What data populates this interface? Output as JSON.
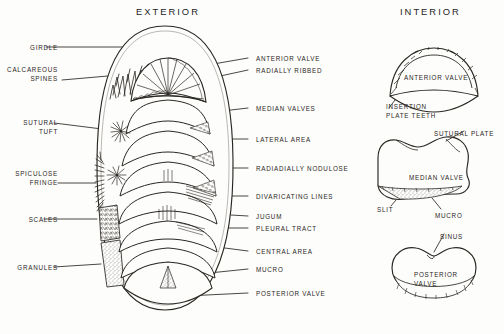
{
  "figure": {
    "kind": "scientific-illustration",
    "style": "hand-drawn ink line diagram",
    "background_color": "#fdfdfc",
    "ink_color": "#2a2722"
  },
  "panels": {
    "exterior": {
      "title": "EXTERIOR"
    },
    "interior": {
      "title": "INTERIOR"
    }
  },
  "left_labels": [
    {
      "id": "girdle",
      "lines": [
        "GIRDLE"
      ],
      "x": 14,
      "y": 44,
      "lead_from": [
        46,
        47
      ],
      "lead_to": [
        150,
        47
      ]
    },
    {
      "id": "calcareous-spines",
      "lines": [
        "CALCAREOUS",
        "SPINES"
      ],
      "x": 14,
      "y": 66,
      "lead_from": [
        62,
        80
      ],
      "lead_to": [
        131,
        74
      ]
    },
    {
      "id": "sutural-tuft",
      "lines": [
        "SUTURAL",
        "TUFT"
      ],
      "x": 14,
      "y": 119,
      "lead_from": [
        54,
        123
      ],
      "lead_to": [
        118,
        131
      ]
    },
    {
      "id": "spiculose-fringe",
      "lines": [
        "SPICULOSE",
        "FRINGE"
      ],
      "x": 14,
      "y": 170,
      "lead_from": [
        58,
        183
      ],
      "lead_to": [
        96,
        183
      ]
    },
    {
      "id": "scales",
      "lines": [
        "SCALES"
      ],
      "x": 14,
      "y": 216,
      "lead_from": [
        44,
        219
      ],
      "lead_to": [
        97,
        219
      ]
    },
    {
      "id": "granules",
      "lines": [
        "GRANULES"
      ],
      "x": 14,
      "y": 264,
      "lead_from": [
        54,
        267
      ],
      "lead_to": [
        101,
        264
      ]
    }
  ],
  "right_labels": [
    {
      "id": "anterior-valve",
      "text": "ANTERIOR VALVE",
      "x": 256,
      "y": 55,
      "lead_from": [
        248,
        58
      ],
      "lead_to": [
        196,
        67
      ]
    },
    {
      "id": "radially-ribbed",
      "text": "RADIALLY RIBBED",
      "x": 256,
      "y": 67,
      "lead_from": [
        248,
        70
      ],
      "lead_to": [
        188,
        83
      ]
    },
    {
      "id": "median-valves",
      "text": "MEDIAN VALVES",
      "x": 256,
      "y": 105,
      "lead_from": [
        248,
        108
      ],
      "lead_to": [
        205,
        113
      ]
    },
    {
      "id": "lateral-area",
      "text": "LATERAL AREA",
      "x": 256,
      "y": 136,
      "lead_from": [
        248,
        139
      ],
      "lead_to": [
        211,
        139
      ]
    },
    {
      "id": "radiadially-nodulose",
      "text": "RADIADIALLY NODULOSE",
      "x": 256,
      "y": 165,
      "lead_from": [
        248,
        168
      ],
      "lead_to": [
        213,
        168
      ]
    },
    {
      "id": "divaricating-lines",
      "text": "DIVARICATING LINES",
      "x": 256,
      "y": 193,
      "lead_from": [
        248,
        196
      ],
      "lead_to": [
        204,
        196
      ]
    },
    {
      "id": "jugum",
      "text": "JUGUM",
      "x": 256,
      "y": 213,
      "lead_from": [
        248,
        216
      ],
      "lead_to": [
        196,
        213
      ]
    },
    {
      "id": "pleural-tract",
      "text": "PLEURAL TRACT",
      "x": 256,
      "y": 225,
      "lead_from": [
        248,
        228
      ],
      "lead_to": [
        206,
        228
      ]
    },
    {
      "id": "central-area",
      "text": "CENTRAL AREA",
      "x": 256,
      "y": 248,
      "lead_from": [
        248,
        251
      ],
      "lead_to": [
        186,
        243
      ]
    },
    {
      "id": "mucro",
      "text": "MUCRO",
      "x": 256,
      "y": 266,
      "lead_from": [
        248,
        269
      ],
      "lead_to": [
        190,
        275
      ]
    },
    {
      "id": "posterior-valve",
      "text": "POSTERIOR VALVE",
      "x": 256,
      "y": 290,
      "lead_from": [
        248,
        293
      ],
      "lead_to": [
        186,
        296
      ]
    }
  ],
  "interior_labels": [
    {
      "id": "anterior-valve-interior",
      "text": "ANTERIOR VALVE",
      "x": 404,
      "y": 74
    },
    {
      "id": "insertion-plate-teeth",
      "lines": [
        "INSERTION",
        "PLATE TEETH"
      ],
      "x": 386,
      "y": 103
    },
    {
      "id": "sutural-plate",
      "text": "SUTURAL PLATE",
      "x": 434,
      "y": 130
    },
    {
      "id": "median-valve",
      "text": "MEDIAN VALVE",
      "x": 409,
      "y": 174
    },
    {
      "id": "slit",
      "text": "SLIT",
      "x": 377,
      "y": 206
    },
    {
      "id": "mucro-interior",
      "text": "MUCRO",
      "x": 435,
      "y": 212
    },
    {
      "id": "sinus",
      "text": "SINUS",
      "x": 440,
      "y": 233
    },
    {
      "id": "posterior-valve-interior",
      "lines": [
        "POSTERIOR",
        "VALVE"
      ],
      "x": 414,
      "y": 271
    }
  ],
  "exterior_body": {
    "description": "dorsal view of chiton: elliptical girdle enclosing eight overlapping shell valves",
    "valve_count": 8,
    "girdle_textures": [
      "calcareous spines",
      "spiculose fringe",
      "scales",
      "granules"
    ]
  }
}
